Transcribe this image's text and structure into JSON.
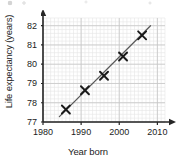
{
  "chart_data": {
    "type": "scatter",
    "title": "",
    "xlabel": "Year born",
    "ylabel": "Life expectancy (years)",
    "xlim": [
      1980,
      2012
    ],
    "ylim": [
      77,
      82.4
    ],
    "xticks": [
      1980,
      1990,
      2000,
      2010
    ],
    "yticks": [
      77,
      78,
      79,
      80,
      81,
      82
    ],
    "xtick_labels": [
      "1980",
      "1990",
      "2000",
      "2010"
    ],
    "ytick_labels": [
      "77",
      "78",
      "79",
      "80",
      "81",
      "82"
    ],
    "grid": true,
    "grid_minor": true,
    "grid_minor_step_x": 1,
    "grid_minor_step_y": 0.2,
    "legend": false,
    "marker": "x",
    "points": [
      {
        "x": 1986,
        "y": 77.65
      },
      {
        "x": 1991,
        "y": 78.65
      },
      {
        "x": 1996,
        "y": 79.4
      },
      {
        "x": 2001,
        "y": 80.4
      },
      {
        "x": 2006,
        "y": 81.5
      }
    ],
    "trend_line": {
      "label": "line of best fit",
      "x_start": 1984.3,
      "y_start": 77.28,
      "x_end": 2008.2,
      "y_end": 82.0
    },
    "axis_arrows": {
      "x": "right",
      "y": "up"
    }
  },
  "colors": {
    "axis": "#262626",
    "marker": "#1a1a1a",
    "trend_line": "#5a5a5a",
    "grid_major": "#c6c6c6",
    "grid_minor": "#e6e6e6",
    "background": "#ffffff",
    "text": "#1c1c1c"
  },
  "geometry": {
    "plot_left": 43,
    "plot_top": 18,
    "plot_width": 122,
    "plot_height": 104
  }
}
